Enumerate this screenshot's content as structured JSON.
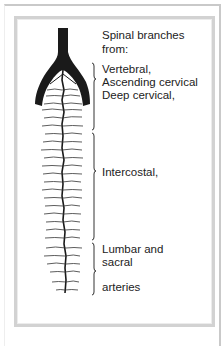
{
  "diagram": {
    "title_line1": "Spinal branches",
    "title_line2": "from:",
    "groups": [
      {
        "lines": [
          "Vertebral,",
          "Ascending cervical",
          "Deep cervical,"
        ]
      },
      {
        "lines": [
          "Intercostal,"
        ]
      },
      {
        "lines": [
          "Lumbar and",
          "sacral",
          "arteries"
        ]
      }
    ]
  },
  "colors": {
    "artery": "#1a1a1a",
    "text": "#222222",
    "frame": "#d2d2d2"
  }
}
